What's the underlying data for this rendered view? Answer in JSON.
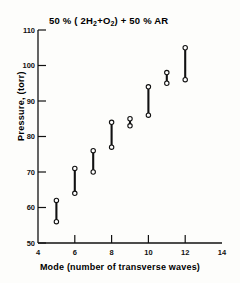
{
  "chart_data": {
    "type": "scatter",
    "title": "50 % ( 2H2+O2) + 50 % AR",
    "title_parts": {
      "lead": "50 % ( 2H",
      "sub1": "2",
      "mid": "+O",
      "sub2": "2",
      "tail": ") + 50 % AR"
    },
    "xlabel": "Mode  (number  of  transverse  waves)",
    "ylabel": "Pressure, (torr)",
    "xlim": [
      4,
      14
    ],
    "ylim": [
      50,
      110
    ],
    "xticks": [
      4,
      6,
      8,
      10,
      12,
      14
    ],
    "xticklabels": [
      "4",
      "6",
      "8",
      "10",
      "12",
      "14"
    ],
    "yticks": [
      50,
      60,
      70,
      80,
      90,
      100,
      110
    ],
    "yticklabels": [
      "50",
      "60",
      "70",
      "80",
      "90",
      "100",
      "110"
    ],
    "grid": false,
    "legend": false,
    "marker": "open-circle",
    "series": [
      {
        "name": "pressure range per mode",
        "description": "vertical bar joining lower and upper open-circle markers at each mode",
        "points": [
          {
            "mode": 5,
            "low": 56,
            "high": 62
          },
          {
            "mode": 6,
            "low": 64,
            "high": 71
          },
          {
            "mode": 7,
            "low": 70,
            "high": 76
          },
          {
            "mode": 8,
            "low": 77,
            "high": 84
          },
          {
            "mode": 9,
            "low": 83,
            "high": 85
          },
          {
            "mode": 10,
            "low": 86,
            "high": 94
          },
          {
            "mode": 11,
            "low": 95,
            "high": 98
          },
          {
            "mode": 12,
            "low": 96,
            "high": 105
          }
        ]
      }
    ],
    "colors": {
      "ink": "#111111",
      "background": "#fdfdfb",
      "marker_fill": "#ffffff"
    }
  }
}
